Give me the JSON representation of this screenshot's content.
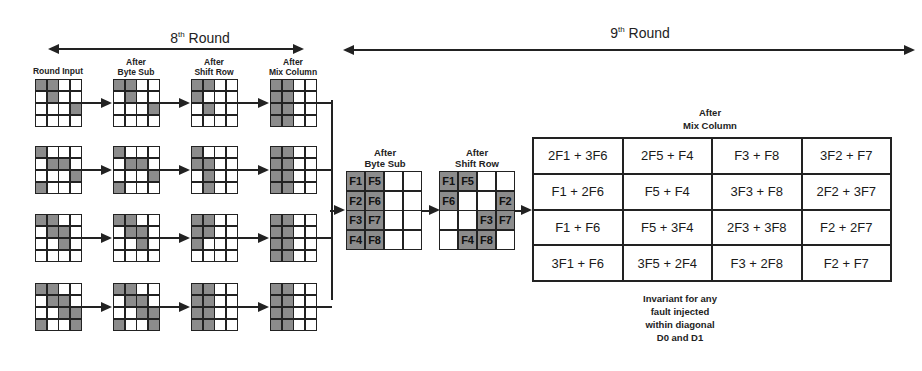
{
  "rounds": {
    "round8": {
      "number": "8",
      "suffix": "th",
      "word": "Round"
    },
    "round9": {
      "number": "9",
      "suffix": "th",
      "word": "Round"
    }
  },
  "round8_steps": {
    "labels": [
      "Round Input",
      "After\nByte Sub",
      "After\nShift Row",
      "After\nMix Column"
    ],
    "label_lines": [
      [
        "Round Input"
      ],
      [
        "After",
        "Byte Sub"
      ],
      [
        "After",
        "Shift Row"
      ],
      [
        "After",
        "Mix Column"
      ]
    ],
    "rows": [
      [
        [
          [
            1,
            1,
            0,
            0
          ],
          [
            0,
            1,
            0,
            0
          ],
          [
            0,
            0,
            0,
            1
          ],
          [
            0,
            0,
            0,
            0
          ]
        ],
        [
          [
            1,
            1,
            0,
            0
          ],
          [
            0,
            1,
            0,
            0
          ],
          [
            0,
            0,
            0,
            1
          ],
          [
            0,
            0,
            0,
            0
          ]
        ],
        [
          [
            1,
            1,
            0,
            0
          ],
          [
            1,
            0,
            0,
            0
          ],
          [
            0,
            1,
            0,
            0
          ],
          [
            0,
            0,
            0,
            0
          ]
        ],
        [
          [
            1,
            1,
            0,
            0
          ],
          [
            1,
            1,
            0,
            0
          ],
          [
            1,
            1,
            0,
            0
          ],
          [
            1,
            1,
            0,
            0
          ]
        ]
      ],
      [
        [
          [
            1,
            0,
            0,
            0
          ],
          [
            0,
            1,
            1,
            0
          ],
          [
            0,
            0,
            0,
            1
          ],
          [
            1,
            0,
            0,
            0
          ]
        ],
        [
          [
            1,
            0,
            0,
            0
          ],
          [
            0,
            1,
            1,
            0
          ],
          [
            0,
            0,
            0,
            1
          ],
          [
            1,
            0,
            0,
            0
          ]
        ],
        [
          [
            1,
            0,
            0,
            0
          ],
          [
            1,
            1,
            0,
            0
          ],
          [
            0,
            1,
            0,
            0
          ],
          [
            0,
            1,
            0,
            0
          ]
        ],
        [
          [
            1,
            1,
            0,
            0
          ],
          [
            1,
            1,
            0,
            0
          ],
          [
            1,
            1,
            0,
            0
          ],
          [
            1,
            1,
            0,
            0
          ]
        ]
      ],
      [
        [
          [
            1,
            1,
            0,
            0
          ],
          [
            0,
            1,
            1,
            0
          ],
          [
            0,
            0,
            1,
            0
          ],
          [
            0,
            0,
            0,
            0
          ]
        ],
        [
          [
            1,
            1,
            0,
            0
          ],
          [
            0,
            1,
            1,
            0
          ],
          [
            0,
            0,
            1,
            0
          ],
          [
            0,
            0,
            0,
            0
          ]
        ],
        [
          [
            1,
            1,
            0,
            0
          ],
          [
            1,
            1,
            0,
            0
          ],
          [
            1,
            0,
            0,
            0
          ],
          [
            0,
            0,
            0,
            0
          ]
        ],
        [
          [
            1,
            1,
            0,
            0
          ],
          [
            1,
            1,
            0,
            0
          ],
          [
            1,
            1,
            0,
            0
          ],
          [
            1,
            1,
            0,
            0
          ]
        ]
      ],
      [
        [
          [
            1,
            1,
            0,
            0
          ],
          [
            0,
            1,
            1,
            0
          ],
          [
            0,
            0,
            1,
            1
          ],
          [
            1,
            0,
            0,
            1
          ]
        ],
        [
          [
            1,
            1,
            0,
            0
          ],
          [
            0,
            1,
            1,
            0
          ],
          [
            0,
            0,
            1,
            1
          ],
          [
            1,
            0,
            0,
            1
          ]
        ],
        [
          [
            1,
            1,
            0,
            0
          ],
          [
            1,
            1,
            0,
            0
          ],
          [
            1,
            1,
            0,
            0
          ],
          [
            1,
            1,
            0,
            0
          ]
        ],
        [
          [
            1,
            1,
            0,
            0
          ],
          [
            1,
            1,
            0,
            0
          ],
          [
            1,
            1,
            0,
            0
          ],
          [
            1,
            1,
            0,
            0
          ]
        ]
      ]
    ]
  },
  "round9_byte_sub": {
    "label_lines": [
      "After",
      "Byte Sub"
    ],
    "cells": [
      [
        "F1",
        "F5",
        "",
        ""
      ],
      [
        "F2",
        "F6",
        "",
        ""
      ],
      [
        "F3",
        "F7",
        "",
        ""
      ],
      [
        "F4",
        "F8",
        "",
        ""
      ]
    ],
    "shaded": [
      [
        1,
        1,
        0,
        0
      ],
      [
        1,
        1,
        0,
        0
      ],
      [
        1,
        1,
        0,
        0
      ],
      [
        1,
        1,
        0,
        0
      ]
    ]
  },
  "round9_shift_row": {
    "label_lines": [
      "After",
      "Shift Row"
    ],
    "cells": [
      [
        "F1",
        "F5",
        "",
        ""
      ],
      [
        "F6",
        "",
        "",
        "F2"
      ],
      [
        "",
        "",
        "F3",
        "F7"
      ],
      [
        "",
        "F4",
        "F8",
        ""
      ]
    ],
    "shaded": [
      [
        1,
        1,
        0,
        0
      ],
      [
        1,
        0,
        0,
        1
      ],
      [
        0,
        0,
        1,
        1
      ],
      [
        0,
        1,
        1,
        0
      ]
    ]
  },
  "round9_mix_column": {
    "label_lines": [
      "After",
      "Mix Column"
    ],
    "cells": [
      [
        "2F1 + 3F6",
        "2F5 + F4",
        "F3 + F8",
        "3F2 + F7"
      ],
      [
        "F1 + 2F6",
        "F5 + F4",
        "3F3 + F8",
        "2F2 + 3F7"
      ],
      [
        "F1 + F6",
        "F5 + 3F4",
        "2F3 + 3F8",
        "F2 + 2F7"
      ],
      [
        "3F1 + F6",
        "3F5 + 2F4",
        "F3 + 2F8",
        "F2 + F7"
      ]
    ]
  },
  "note": {
    "lines": [
      "Invariant for any",
      "fault injected",
      "within diagonal",
      "D0 and D1"
    ]
  },
  "colors": {
    "shaded": "#8c8c8c",
    "line": "#222222",
    "background": "#ffffff"
  }
}
